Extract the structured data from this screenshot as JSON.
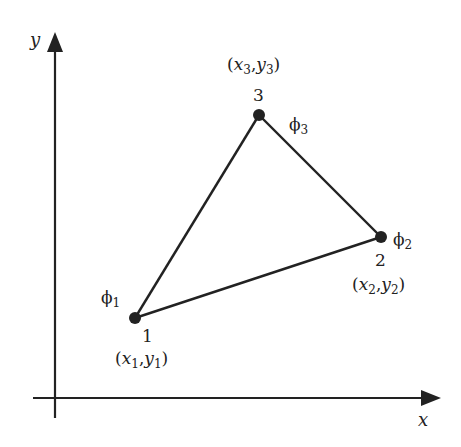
{
  "diagram": {
    "type": "triangular-finite-element",
    "colors": {
      "stroke": "#222222",
      "background": "#ffffff"
    },
    "axes": {
      "x_label": "x",
      "y_label": "y"
    },
    "nodes": [
      {
        "id": "1",
        "number": "1",
        "phi_symbol": "ϕ",
        "phi_sub": "1",
        "coord_x": "x",
        "coord_x_sub": "1",
        "coord_y": "y",
        "coord_y_sub": "1",
        "px": 135,
        "py": 318
      },
      {
        "id": "2",
        "number": "2",
        "phi_symbol": "ϕ",
        "phi_sub": "2",
        "coord_x": "x",
        "coord_x_sub": "2",
        "coord_y": "y",
        "coord_y_sub": "2",
        "px": 381,
        "py": 237
      },
      {
        "id": "3",
        "number": "3",
        "phi_symbol": "ϕ",
        "phi_sub": "3",
        "coord_x": "x",
        "coord_x_sub": "3",
        "coord_y": "y",
        "coord_y_sub": "3",
        "px": 259,
        "py": 115
      }
    ],
    "edges": [
      [
        "1",
        "2"
      ],
      [
        "2",
        "3"
      ],
      [
        "3",
        "1"
      ]
    ],
    "punctuation": {
      "open": "(",
      "comma": ",",
      "close": ")"
    }
  }
}
